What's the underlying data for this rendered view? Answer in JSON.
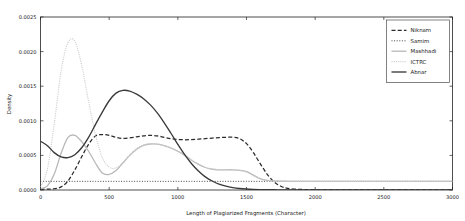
{
  "chart_data": {
    "type": "line",
    "title": "",
    "xlabel": "Length of Plagiarized Fragments (Character)",
    "ylabel": "Density",
    "xlim": [
      0,
      3000
    ],
    "ylim": [
      0.0,
      0.0025
    ],
    "xticks": [
      0,
      500,
      1000,
      1500,
      2000,
      2500,
      3000
    ],
    "xtick_labels": [
      "0",
      "500",
      "1000",
      "1500",
      "2000",
      "2500",
      "3000"
    ],
    "yticks": [
      0.0,
      0.0005,
      0.001,
      0.0015,
      0.002,
      0.0025
    ],
    "ytick_labels": [
      "0.0000",
      "0.0005",
      "0.0010",
      "0.0015",
      "0.0020",
      "0.0025"
    ],
    "grid": false,
    "legend_position": "upper right",
    "x": [
      0,
      50,
      100,
      150,
      200,
      250,
      300,
      350,
      400,
      450,
      500,
      550,
      600,
      650,
      700,
      750,
      800,
      850,
      900,
      950,
      1000,
      1050,
      1100,
      1150,
      1200,
      1250,
      1300,
      1350,
      1400,
      1450,
      1500,
      1550,
      1600,
      1650,
      1700,
      1750,
      1800,
      1900,
      2000,
      2200,
      2400,
      2600,
      2800,
      3000
    ],
    "series": [
      {
        "name": "Niknam",
        "color": "#2b2b2b",
        "dash": "4,2.2",
        "width": 1.25,
        "values": [
          1e-05,
          1.2e-05,
          1.8e-05,
          4.5e-05,
          0.00013,
          0.00029,
          0.00048,
          0.00066,
          0.00078,
          0.0008,
          0.00079,
          0.00076,
          0.000745,
          0.000752,
          0.000768,
          0.000782,
          0.00079,
          0.000782,
          0.000762,
          0.000742,
          0.00073,
          0.000726,
          0.000728,
          0.000734,
          0.000742,
          0.00075,
          0.000757,
          0.000762,
          0.000764,
          0.000742,
          0.00067,
          0.00054,
          0.00038,
          0.00023,
          0.00012,
          5.5e-05,
          2.5e-05,
          8e-06,
          4e-06,
          2e-06,
          1e-06,
          1e-06,
          1e-06,
          1e-06
        ]
      },
      {
        "name": "Samim",
        "color": "#3d3d3d",
        "dash": "1,1.6",
        "width": 0.95,
        "values": [
          0.000125,
          0.000125,
          0.000125,
          0.000125,
          0.000125,
          0.000125,
          0.000125,
          0.000125,
          0.000125,
          0.000125,
          0.000125,
          0.000125,
          0.000125,
          0.000125,
          0.000125,
          0.000125,
          0.000125,
          0.000125,
          0.000125,
          0.000125,
          0.000125,
          0.000125,
          0.000125,
          0.000125,
          0.000125,
          0.000125,
          0.000125,
          0.000125,
          0.000125,
          0.000125,
          0.000125,
          0.000125,
          0.000125,
          0.000125,
          0.000125,
          0.000125,
          0.000125,
          0.000125,
          0.000125,
          0.000125,
          0.000125,
          0.000125,
          0.000125,
          0.000125
        ]
      },
      {
        "name": "Mashhadi",
        "color": "#b8b8b8",
        "dash": "none",
        "width": 1.3,
        "values": [
          2e-05,
          6e-05,
          0.00023,
          0.00053,
          0.00076,
          0.00079,
          0.0007,
          0.00056,
          0.00039,
          0.000245,
          0.000225,
          0.00028,
          0.00039,
          0.0005,
          0.00059,
          0.000645,
          0.000665,
          0.000662,
          0.00064,
          0.000605,
          0.00056,
          0.0005,
          0.00043,
          0.00037,
          0.000325,
          0.0003,
          0.000292,
          0.000292,
          0.000292,
          0.000285,
          0.000265,
          0.000215,
          0.000165,
          0.00014,
          0.00013,
          0.000127,
          0.000126,
          0.000125,
          0.000125,
          0.000125,
          0.000125,
          0.000125,
          0.000125,
          0.000125
        ]
      },
      {
        "name": "ICTRC",
        "color": "#cfcfcf",
        "dash": "1.1,1.1",
        "width": 1.15,
        "values": [
          4e-05,
          0.0003,
          0.00095,
          0.00172,
          0.00213,
          0.00215,
          0.0018,
          0.00128,
          0.0008,
          0.00047,
          0.00033,
          0.00032,
          0.0004,
          0.00051,
          0.0006,
          0.00065,
          0.000668,
          0.000664,
          0.000642,
          0.000608,
          0.000562,
          0.000504,
          0.000436,
          0.000374,
          0.00033,
          0.000302,
          0.000294,
          0.000294,
          0.000292,
          0.000282,
          0.000258,
          0.000205,
          0.000158,
          0.000136,
          0.000128,
          0.000126,
          0.000125,
          0.000125,
          0.000125,
          0.000125,
          0.000125,
          0.000125,
          0.000125,
          0.000125
        ]
      },
      {
        "name": "Abnar",
        "color": "#3a3a3a",
        "dash": "none",
        "width": 1.35,
        "values": [
          0.000705,
          0.00064,
          0.00054,
          0.000478,
          0.000468,
          0.00051,
          0.00061,
          0.00076,
          0.000945,
          0.001125,
          0.00129,
          0.0014,
          0.00144,
          0.00143,
          0.001385,
          0.00132,
          0.00123,
          0.001115,
          0.000975,
          0.00082,
          0.00066,
          0.00051,
          0.00038,
          0.000275,
          0.00019,
          0.00013,
          8.5e-05,
          5.5e-05,
          3.5e-05,
          2.2e-05,
          1.4e-05,
          9e-06,
          6e-06,
          4e-06,
          3e-06,
          2e-06,
          2e-06,
          1e-06,
          1e-06,
          1e-06,
          1e-06,
          1e-06,
          1e-06,
          1e-06
        ]
      }
    ]
  },
  "legend": {
    "items": [
      {
        "label": "Niknam"
      },
      {
        "label": "Samim"
      },
      {
        "label": "Mashhadi"
      },
      {
        "label": "ICTRC"
      },
      {
        "label": "Abnar"
      }
    ]
  }
}
